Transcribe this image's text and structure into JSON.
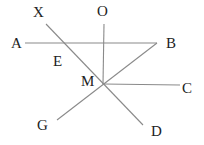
{
  "diagram": {
    "type": "geometry",
    "stroke_color": "#8a8a8a",
    "label_color": "#222222",
    "points": {
      "X": {
        "label": "X",
        "x": 46,
        "y": 24,
        "label_x": 33,
        "label_y": 17
      },
      "O": {
        "label": "O",
        "x": 104,
        "y": 24,
        "label_x": 97,
        "label_y": 16
      },
      "A": {
        "label": "A",
        "x": 25,
        "y": 43,
        "label_x": 11,
        "label_y": 48
      },
      "B": {
        "label": "B",
        "x": 157,
        "y": 43,
        "label_x": 166,
        "label_y": 48
      },
      "E": {
        "label": "E",
        "x": 64,
        "y": 43,
        "label_x": 53,
        "label_y": 66
      },
      "M": {
        "label": "M",
        "x": 103,
        "y": 84,
        "label_x": 81,
        "label_y": 86
      },
      "C": {
        "label": "C",
        "x": 180,
        "y": 85,
        "label_x": 182,
        "label_y": 93
      },
      "G": {
        "label": "G",
        "x": 57,
        "y": 120,
        "label_x": 37,
        "label_y": 130
      },
      "D": {
        "label": "D",
        "x": 143,
        "y": 125,
        "label_x": 151,
        "label_y": 136
      }
    },
    "segments": [
      {
        "name": "segment-ab",
        "from": "A",
        "to": "B"
      },
      {
        "name": "segment-om",
        "from": "O",
        "to": "M"
      },
      {
        "name": "segment-xd",
        "from": "X",
        "to": "D"
      },
      {
        "name": "segment-bg",
        "from": "B",
        "to": "G"
      },
      {
        "name": "segment-mc",
        "from": "M",
        "to": "C"
      }
    ],
    "labels": [
      "X",
      "O",
      "A",
      "B",
      "E",
      "M",
      "C",
      "G",
      "D"
    ]
  }
}
